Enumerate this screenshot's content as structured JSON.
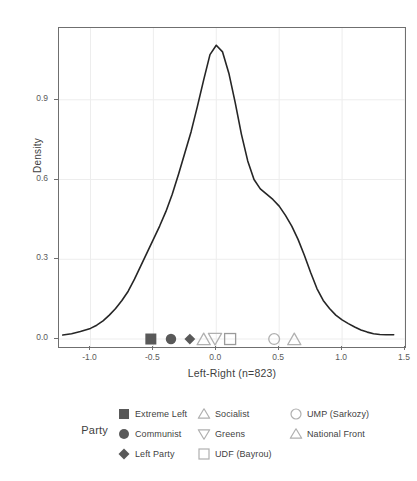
{
  "chart_data": {
    "type": "line",
    "title": "",
    "xlabel": "Left-Right (n=823)",
    "ylabel": "Density",
    "xlim": [
      -1.25,
      1.5
    ],
    "ylim": [
      -0.03,
      1.17
    ],
    "grid": true,
    "xticks": [
      "-1.0",
      "-0.5",
      "0.0",
      "0.5",
      "1.0",
      "1.5"
    ],
    "xtick_values": [
      -1.0,
      -0.5,
      0.0,
      0.5,
      1.0,
      1.5
    ],
    "yticks": [
      "0.0",
      "0.3",
      "0.6",
      "0.9"
    ],
    "ytick_values": [
      0.0,
      0.3,
      0.6,
      0.9
    ],
    "series": [
      {
        "name": "Density",
        "x": [
          -1.22,
          -1.15,
          -1.08,
          -1.0,
          -0.95,
          -0.9,
          -0.85,
          -0.8,
          -0.75,
          -0.7,
          -0.65,
          -0.6,
          -0.55,
          -0.5,
          -0.45,
          -0.4,
          -0.35,
          -0.3,
          -0.25,
          -0.2,
          -0.15,
          -0.1,
          -0.05,
          0.0,
          0.05,
          0.1,
          0.15,
          0.2,
          0.25,
          0.3,
          0.35,
          0.4,
          0.45,
          0.5,
          0.55,
          0.6,
          0.65,
          0.7,
          0.75,
          0.8,
          0.85,
          0.9,
          0.95,
          1.0,
          1.05,
          1.1,
          1.15,
          1.2,
          1.25,
          1.3,
          1.35,
          1.41
        ],
        "y": [
          0.015,
          0.02,
          0.028,
          0.04,
          0.052,
          0.068,
          0.09,
          0.115,
          0.145,
          0.18,
          0.225,
          0.275,
          0.325,
          0.375,
          0.425,
          0.48,
          0.545,
          0.62,
          0.7,
          0.78,
          0.875,
          0.975,
          1.07,
          1.105,
          1.08,
          1.0,
          0.89,
          0.77,
          0.67,
          0.6,
          0.565,
          0.545,
          0.525,
          0.5,
          0.465,
          0.425,
          0.375,
          0.315,
          0.25,
          0.19,
          0.145,
          0.115,
          0.09,
          0.072,
          0.058,
          0.045,
          0.034,
          0.026,
          0.02,
          0.017,
          0.016,
          0.016
        ]
      }
    ],
    "party_markers": [
      {
        "party": "Extreme Left",
        "x": -0.52,
        "y": 0.0,
        "shape": "filled-square",
        "color": "#595959"
      },
      {
        "party": "Communist",
        "x": -0.36,
        "y": 0.0,
        "shape": "filled-circle",
        "color": "#595959"
      },
      {
        "party": "Left Party",
        "x": -0.21,
        "y": 0.0,
        "shape": "filled-diamond",
        "color": "#595959"
      },
      {
        "party": "Socialist",
        "x": -0.1,
        "y": 0.0,
        "shape": "open-triangle-up",
        "color": "#b0b0b0"
      },
      {
        "party": "Greens",
        "x": -0.01,
        "y": 0.0,
        "shape": "open-triangle-down",
        "color": "#b0b0b0"
      },
      {
        "party": "UDF (Bayrou)",
        "x": 0.11,
        "y": 0.0,
        "shape": "open-square",
        "color": "#9a9a9a"
      },
      {
        "party": "UMP (Sarkozy)",
        "x": 0.46,
        "y": 0.0,
        "shape": "open-circle",
        "color": "#b0b0b0"
      },
      {
        "party": "National Front",
        "x": 0.62,
        "y": 0.0,
        "shape": "open-triangle-up",
        "color": "#b0b0b0"
      }
    ]
  },
  "axis": {
    "y_title": "Density",
    "x_title": "Left-Right (n=823)",
    "y_tick_labels": [
      "0.9",
      "0.6",
      "0.3",
      "0.0"
    ],
    "x_tick_labels": [
      "-1.0",
      "-0.5",
      "0.0",
      "0.5",
      "1.0",
      "1.5"
    ]
  },
  "legend": {
    "title": "Party",
    "columns": [
      {
        "entries": [
          {
            "label": "Extreme Left",
            "marker": "filled-square-icon"
          },
          {
            "label": "Communist",
            "marker": "filled-circle-icon"
          },
          {
            "label": "Left Party",
            "marker": "filled-diamond-icon"
          }
        ]
      },
      {
        "entries": [
          {
            "label": "Socialist",
            "marker": "open-triangle-up-icon"
          },
          {
            "label": "Greens",
            "marker": "open-triangle-down-icon"
          },
          {
            "label": "UDF (Bayrou)",
            "marker": "open-square-icon"
          }
        ]
      },
      {
        "entries": [
          {
            "label": "UMP (Sarkozy)",
            "marker": "open-circle-icon"
          },
          {
            "label": "National Front",
            "marker": "open-triangle-up-icon"
          }
        ]
      }
    ]
  },
  "colors": {
    "curve": "#262626",
    "panel_border": "#6f6f6f",
    "grid": "#ededed",
    "filled_marker": "#595959",
    "open_marker": "#b0b0b0",
    "text": "#3f3f3f",
    "background": "#ffffff"
  }
}
